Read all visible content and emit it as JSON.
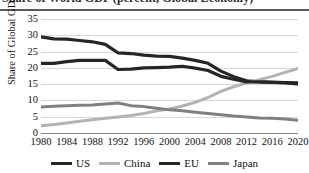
{
  "figure": {
    "title": "Share of World GDP (percent, Global Economy)",
    "title_clipped": true
  },
  "axes": {
    "y_title": "Share of Global GDP (%)",
    "y_ticks": [
      "0",
      "5",
      "10",
      "15",
      "20",
      "25",
      "30",
      "35"
    ],
    "x_ticks": [
      "1980",
      "1984",
      "1988",
      "1992",
      "1996",
      "2000",
      "2004",
      "2008",
      "2012",
      "2016",
      "2020"
    ]
  },
  "legend": {
    "items": [
      {
        "label": "US",
        "color": "#262626"
      },
      {
        "label": "China",
        "color": "#b3b3b3"
      },
      {
        "label": "EU",
        "color": "#262626"
      },
      {
        "label": "Japan",
        "color": "#808080"
      }
    ]
  },
  "chart_data": {
    "type": "line",
    "title": "Share of World GDP (percent, Global Economy)",
    "xlabel": "",
    "ylabel": "Share of Global GDP (%)",
    "xlim": [
      1980,
      2020
    ],
    "ylim": [
      0,
      35
    ],
    "ytick_step": 5,
    "grid": true,
    "legend_position": "bottom",
    "x": [
      1980,
      1982,
      1984,
      1986,
      1988,
      1990,
      1992,
      1994,
      1996,
      1998,
      2000,
      2002,
      2004,
      2006,
      2008,
      2010,
      2012,
      2014,
      2016,
      2018,
      2020
    ],
    "series": [
      {
        "name": "US",
        "color": "#262626",
        "width": 3.2,
        "values": [
          29.5,
          28.9,
          28.8,
          28.4,
          28.0,
          27.2,
          24.6,
          24.4,
          23.9,
          23.6,
          23.5,
          23.0,
          22.3,
          21.4,
          19.0,
          17.3,
          16.0,
          15.7,
          15.5,
          15.4,
          15.1
        ]
      },
      {
        "name": "China",
        "color": "#b3b3b3",
        "width": 3.0,
        "values": [
          2.2,
          2.6,
          3.1,
          3.6,
          4.1,
          4.5,
          4.9,
          5.4,
          6.0,
          6.8,
          7.4,
          8.3,
          9.4,
          10.9,
          12.8,
          14.2,
          15.4,
          16.4,
          17.4,
          18.6,
          19.8
        ]
      },
      {
        "name": "EU",
        "color": "#262626",
        "width": 3.2,
        "values": [
          21.4,
          21.4,
          21.9,
          22.3,
          22.3,
          22.3,
          19.5,
          19.6,
          20.0,
          20.1,
          20.2,
          20.5,
          19.9,
          19.2,
          17.4,
          16.5,
          15.7,
          15.7,
          15.6,
          15.5,
          15.4
        ]
      },
      {
        "name": "Japan",
        "color": "#808080",
        "width": 3.0,
        "values": [
          8.0,
          8.2,
          8.4,
          8.5,
          8.6,
          8.9,
          9.2,
          8.4,
          8.1,
          7.6,
          7.1,
          6.8,
          6.4,
          6.0,
          5.6,
          5.2,
          4.9,
          4.6,
          4.5,
          4.3,
          3.9
        ]
      }
    ]
  }
}
